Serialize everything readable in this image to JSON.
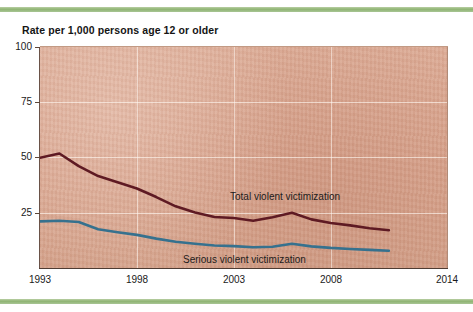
{
  "figure": {
    "title": "Rate per 1,000 persons age 12 or older",
    "background_color": "#d9a58f",
    "rule_color": "#8fb473"
  },
  "axes": {
    "y_ticks": [
      "100",
      "75",
      "50",
      "25"
    ],
    "y_tick_values": [
      100,
      75,
      50,
      25
    ],
    "x_ticks": [
      "1993",
      "1998",
      "2003",
      "2008",
      "2014"
    ],
    "x_tick_values": [
      1993,
      1998,
      2003,
      2008,
      2014
    ]
  },
  "annotations": {
    "total_label": "Total violent victimization",
    "serious_label": "Serious violent victimization"
  },
  "chart_data": {
    "type": "line",
    "title": "Rate per 1,000 persons age 12 or older",
    "xlabel": "",
    "ylabel": "Rate per 1,000 persons age 12 or older",
    "xlim": [
      1993,
      2014
    ],
    "ylim": [
      0,
      100
    ],
    "grid": true,
    "legend_position": "inline-annotations",
    "x": [
      1993,
      1994,
      1995,
      1996,
      1997,
      1998,
      1999,
      2000,
      2001,
      2002,
      2003,
      2004,
      2005,
      2006,
      2007,
      2008,
      2009,
      2010,
      2011
    ],
    "series": [
      {
        "name": "Total violent victimization",
        "color": "#5e1a23",
        "values": [
          49.9,
          51.8,
          46.1,
          41.6,
          38.8,
          36.0,
          32.1,
          27.9,
          25.1,
          23.1,
          22.6,
          21.4,
          23.0,
          25.0,
          22.0,
          20.4,
          19.3,
          18.0,
          17.1
        ]
      },
      {
        "name": "Serious violent victimization",
        "color": "#36718e",
        "values": [
          21.1,
          21.4,
          20.8,
          17.5,
          16.2,
          15.0,
          13.3,
          11.9,
          11.0,
          10.2,
          9.9,
          9.4,
          9.6,
          11.0,
          9.8,
          9.1,
          8.6,
          8.2,
          7.8
        ]
      }
    ]
  }
}
